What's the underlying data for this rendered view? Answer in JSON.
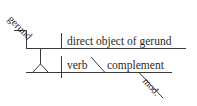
{
  "diagram": {
    "type": "sentence-diagram",
    "labels": {
      "gerund": "gerund",
      "direct_object": "direct object of gerund",
      "verb": "verb",
      "complement": "complement",
      "modifier": "mod."
    },
    "colors": {
      "line": "#3a3a3a",
      "text": "#2b2b2b",
      "background": "#ffffff"
    }
  }
}
